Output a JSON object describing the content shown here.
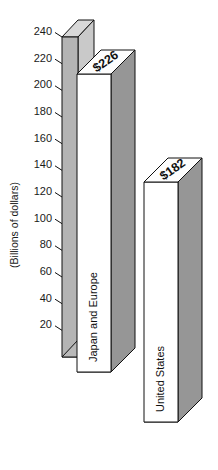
{
  "chart_data": {
    "type": "bar",
    "title": "",
    "subtitle": "",
    "xlabel": "",
    "ylabel": "(Billions of dollars)",
    "categories": [
      "Japan and Europe",
      "United States"
    ],
    "values": [
      226,
      182
    ],
    "value_labels": [
      "$226",
      "$182"
    ],
    "ylim": [
      0,
      240
    ],
    "ytick_labels": [
      "240",
      "220",
      "200",
      "180",
      "160",
      "140",
      "120",
      "100",
      "80",
      "60",
      "40",
      "20"
    ],
    "ytick_values": [
      240,
      220,
      200,
      180,
      160,
      140,
      120,
      100,
      80,
      60,
      40,
      20
    ],
    "grid": false,
    "legend": false,
    "legend_position": "none",
    "style": "3d-isometric",
    "colors": {
      "bar_front": "#ffffff",
      "bar_side": "#969696",
      "bar_top": "#fdfdfd",
      "bar_base": "#b9b9b9",
      "axis_wall": "#b4b4b4",
      "outline": "#101010",
      "text": "#111111",
      "background": "#ffffff"
    }
  }
}
